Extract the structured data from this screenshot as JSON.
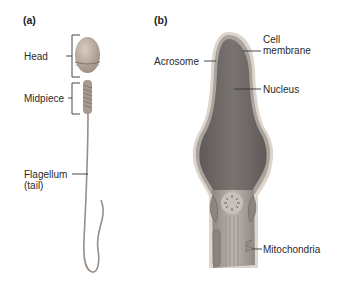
{
  "panels": {
    "a": {
      "label": "(a)",
      "labels": {
        "head": "Head",
        "midpiece": "Midpiece",
        "flagellum_line1": "Flagellum",
        "flagellum_line2": "(tail)"
      }
    },
    "b": {
      "label": "(b)",
      "labels": {
        "cell_membrane_line1": "Cell",
        "cell_membrane_line2": "membrane",
        "acrosome": "Acrosome",
        "nucleus": "Nucleus",
        "mitochondria": "Mitochondria"
      }
    }
  },
  "colors": {
    "head_fill": "#b8a89a",
    "nucleus_fill": "#6f6a68",
    "acrosome_fill": "#a9a19b",
    "membrane_fill": "#d7cfc8",
    "midpiece_fill": "#a49c96",
    "leader_line": "#333333"
  }
}
